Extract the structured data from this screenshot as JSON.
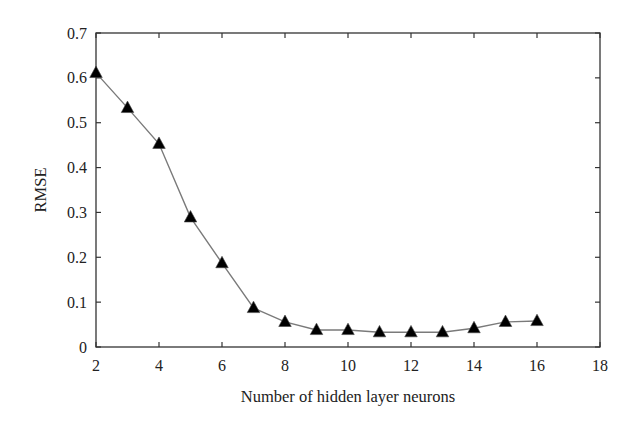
{
  "chart_data": {
    "type": "line",
    "title": "",
    "xlabel": "Number of hidden layer neurons",
    "ylabel": "RMSE",
    "xlim": [
      2,
      18
    ],
    "ylim": [
      0,
      0.7
    ],
    "xticks": [
      2,
      4,
      6,
      8,
      10,
      12,
      14,
      16,
      18
    ],
    "xtick_labels": [
      "2",
      "4",
      "6",
      "8",
      "10",
      "12",
      "14",
      "16",
      "18"
    ],
    "yticks": [
      0,
      0.1,
      0.2,
      0.3,
      0.4,
      0.5,
      0.6,
      0.7
    ],
    "ytick_labels": [
      "0",
      "0.1",
      "0.2",
      "0.3",
      "0.4",
      "0.5",
      "0.6",
      "0.7"
    ],
    "grid": false,
    "legend": null,
    "series": [
      {
        "name": "RMSE",
        "marker": "filled-triangle",
        "line_color": "#7a7a7a",
        "marker_color": "#000000",
        "x": [
          2,
          3,
          4,
          5,
          6,
          7,
          8,
          9,
          10,
          11,
          12,
          13,
          14,
          15,
          16
        ],
        "values": [
          0.611,
          0.533,
          0.453,
          0.289,
          0.187,
          0.087,
          0.056,
          0.038,
          0.038,
          0.033,
          0.033,
          0.033,
          0.042,
          0.056,
          0.058
        ]
      }
    ]
  }
}
